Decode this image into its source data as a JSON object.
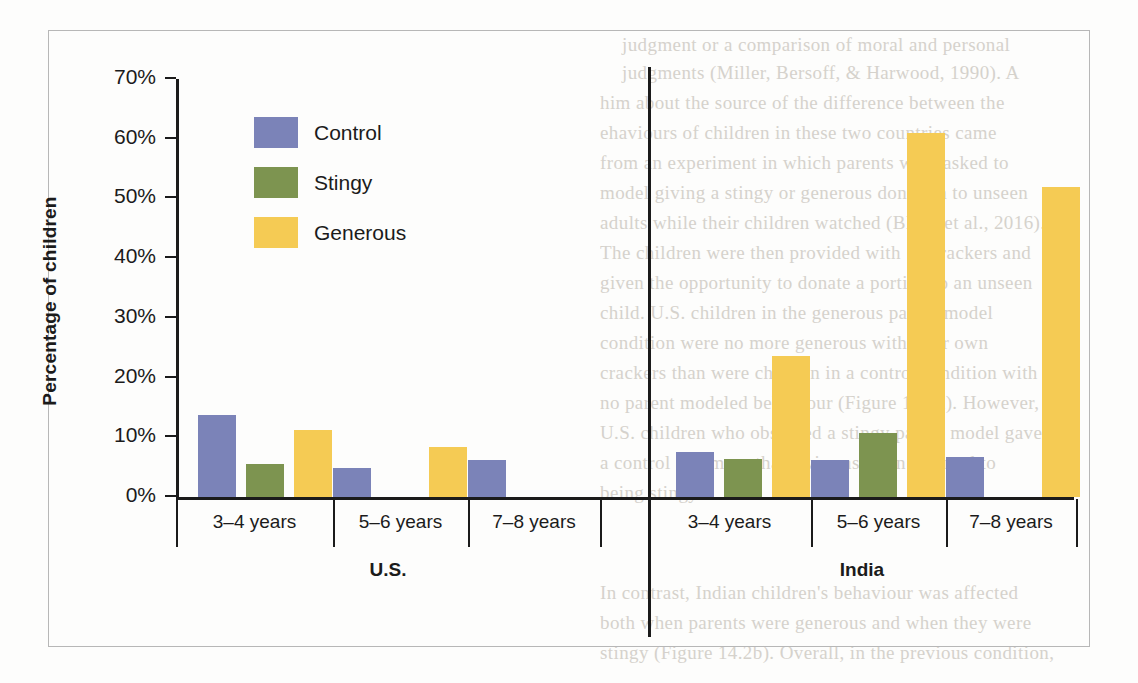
{
  "chart_data": {
    "type": "bar",
    "title": "",
    "xlabel": "",
    "ylabel": "Percentage of children",
    "ylim": [
      0,
      70
    ],
    "ytick_labels": [
      "0%",
      "10%",
      "20%",
      "30%",
      "40%",
      "50%",
      "60%",
      "70%"
    ],
    "ytick_values": [
      0,
      10,
      20,
      30,
      40,
      50,
      60,
      70
    ],
    "grid": false,
    "legend_position": "top-left",
    "panels": [
      {
        "name": "U.S.",
        "categories": [
          "3–4 years",
          "5–6 years",
          "7–8 years"
        ]
      },
      {
        "name": "India",
        "categories": [
          "3–4 years",
          "5–6 years",
          "7–8 years"
        ]
      }
    ],
    "categories": [
      "3–4 years",
      "5–6 years",
      "7–8 years"
    ],
    "series": [
      {
        "name": "Control",
        "color": "#7b83b8",
        "values_us": [
          13.7,
          4.9,
          6.2
        ],
        "values_india": [
          7.5,
          6.2,
          6.7
        ]
      },
      {
        "name": "Stingy",
        "color": "#7d9450",
        "values_us": [
          5.5,
          0,
          0
        ],
        "values_india": [
          6.4,
          10.7,
          0
        ]
      },
      {
        "name": "Generous",
        "color": "#f5cb54",
        "values_us": [
          11.2,
          8.4,
          0
        ],
        "values_india": [
          23.6,
          61.0,
          52.0
        ]
      }
    ]
  },
  "legend": {
    "items": [
      {
        "label": "Control",
        "color": "#7b83b8"
      },
      {
        "label": "Stingy",
        "color": "#7d9450"
      },
      {
        "label": "Generous",
        "color": "#f5cb54"
      }
    ]
  },
  "axis": {
    "y_title": "Percentage of children",
    "y_ticks": [
      "70%",
      "60%",
      "50%",
      "40%",
      "30%",
      "20%",
      "10%",
      "0%"
    ]
  },
  "groups": {
    "us": {
      "country": "U.S.",
      "ages": [
        "3–4 years",
        "5–6 years",
        "7–8 years"
      ]
    },
    "india": {
      "country": "India",
      "ages": [
        "3–4 years",
        "5–6 years",
        "7–8 years"
      ]
    }
  },
  "background_text": {
    "lines": [
      "judgment or a comparison of moral and personal",
      "judgments (Miller, Bersoff, & Harwood, 1990). A",
      "him about the source of the difference between the",
      "ehaviours of children in these two countries came",
      "from an experiment in which parents were asked to",
      "model giving a stingy or generous donation to unseen",
      "adults while their children watched (Blake et al., 2016).",
      "The children were then provided with 10 crackers and",
      "given the opportunity to donate a portion to an unseen",
      "child. U.S. children in the generous parent model",
      "condition were no more generous with their own",
      "crackers than were children in a control condition with",
      "no parent modeled behaviour (Figure 14.2a). However,",
      "U.S. children who observed a stingy parent model gave",
      "a control and more than twice as often resorted to",
      "being stingy.",
      "In contrast, Indian children's behaviour was affected",
      "both when parents were generous and when they were",
      "stingy (Figure 14.2b). Overall, in the previous condition,"
    ]
  }
}
